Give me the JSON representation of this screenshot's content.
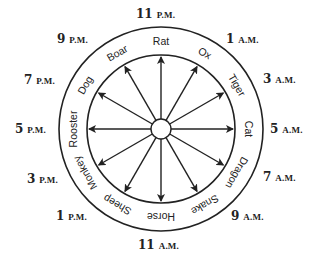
{
  "diagram": {
    "type": "chinese-zodiac-hour-wheel",
    "colors": {
      "line": "#222222",
      "background": "#ffffff"
    },
    "geometry": {
      "cx": 161,
      "cy": 129,
      "outer_r": 102,
      "inner_r": 74,
      "hub_r": 10,
      "label_r": 88,
      "time_r": 124
    },
    "animals": [
      {
        "name": "Rat",
        "angle": 0
      },
      {
        "name": "Ox",
        "angle": 30
      },
      {
        "name": "Tiger",
        "angle": 60
      },
      {
        "name": "Cat",
        "angle": 90
      },
      {
        "name": "Dragon",
        "angle": 120
      },
      {
        "name": "Snake",
        "angle": 150
      },
      {
        "name": "Horse",
        "angle": 180
      },
      {
        "name": "Sheep",
        "angle": 210
      },
      {
        "name": "Monkey",
        "angle": 240
      },
      {
        "name": "Rooster",
        "angle": 270
      },
      {
        "name": "Dog",
        "angle": 300
      },
      {
        "name": "Boar",
        "angle": 330
      }
    ],
    "times": [
      {
        "num": "11",
        "suffix": "P.M.",
        "x": 136,
        "y": 18
      },
      {
        "num": "1",
        "suffix": "A.M.",
        "x": 226,
        "y": 43
      },
      {
        "num": "3",
        "suffix": "A.M.",
        "x": 263,
        "y": 83
      },
      {
        "num": "5",
        "suffix": "A.M.",
        "x": 270,
        "y": 133
      },
      {
        "num": "7",
        "suffix": "A.M.",
        "x": 263,
        "y": 181
      },
      {
        "num": "9",
        "suffix": "A.M.",
        "x": 231,
        "y": 220
      },
      {
        "num": "11",
        "suffix": "A.M.",
        "x": 138,
        "y": 249
      },
      {
        "num": "1",
        "suffix": "P.M.",
        "x": 56,
        "y": 220
      },
      {
        "num": "3",
        "suffix": "P.M.",
        "x": 27,
        "y": 183
      },
      {
        "num": "5",
        "suffix": "P.M.",
        "x": 15,
        "y": 133
      },
      {
        "num": "7",
        "suffix": "P.M.",
        "x": 24,
        "y": 84
      },
      {
        "num": "9",
        "suffix": "P.M.",
        "x": 57,
        "y": 43
      }
    ]
  }
}
